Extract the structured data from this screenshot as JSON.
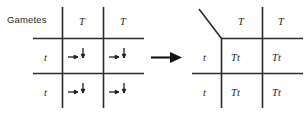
{
  "figure": {
    "title_label": "Gametes",
    "connector_icon": "right-arrow-icon",
    "line_color": "#2b2b2b",
    "text_color": "#1f1f1f",
    "background": "#ffffff"
  },
  "left_square": {
    "name": "punnett-square-gametes",
    "column_headers": [
      "T",
      "T"
    ],
    "row_headers": [
      "t",
      "t"
    ],
    "cells": [
      {
        "row": 0,
        "col": 0,
        "content": "",
        "icons": [
          "right-arrow-icon",
          "down-arrow-icon"
        ]
      },
      {
        "row": 0,
        "col": 1,
        "content": "",
        "icons": [
          "right-arrow-icon",
          "down-arrow-icon"
        ]
      },
      {
        "row": 1,
        "col": 0,
        "content": "",
        "icons": [
          "right-arrow-icon",
          "down-arrow-icon"
        ]
      },
      {
        "row": 1,
        "col": 1,
        "content": "",
        "icons": [
          "right-arrow-icon",
          "down-arrow-icon"
        ]
      }
    ]
  },
  "right_square": {
    "name": "punnett-square-offspring",
    "column_headers": [
      "T",
      "T"
    ],
    "row_headers": [
      "t",
      "t"
    ],
    "corner_marker": "diagonal-slash-icon",
    "cells": [
      {
        "row": 0,
        "col": 0,
        "content": "Tt"
      },
      {
        "row": 0,
        "col": 1,
        "content": "Tt"
      },
      {
        "row": 1,
        "col": 0,
        "content": "Tt"
      },
      {
        "row": 1,
        "col": 1,
        "content": "Tt"
      }
    ]
  }
}
